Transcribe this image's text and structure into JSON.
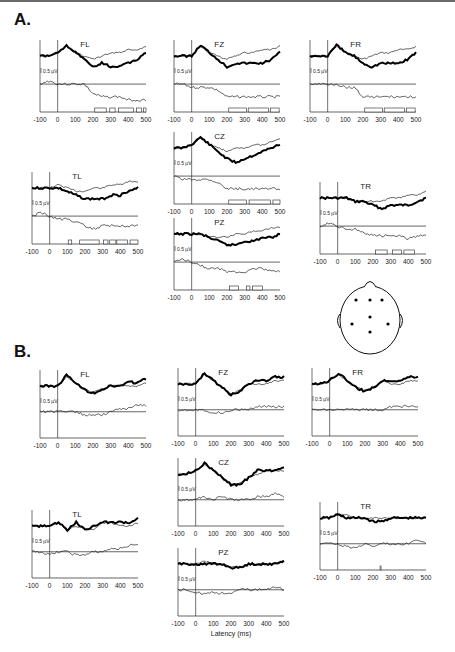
{
  "figure": {
    "section_a_label": "A.",
    "section_b_label": "B.",
    "x_axis_label": "Latency (ms)",
    "scale_bar_label": "0.5 µV",
    "head_map": {
      "electrodes": [
        "FL",
        "FZ",
        "FR",
        "CZ",
        "TL",
        "TR",
        "PZ"
      ]
    }
  },
  "chart_data": [
    {
      "section": "A",
      "type": "line",
      "x_ticks": [
        -100,
        0,
        100,
        200,
        300,
        400,
        500
      ],
      "xlabel": "Latency (ms)",
      "scale_bar": "0.5 µV",
      "panels": [
        {
          "electrode": "FL",
          "thick": [
            0,
            0,
            -1,
            -3,
            -1,
            1,
            3,
            2,
            3,
            3,
            2,
            1,
            -1
          ],
          "thin": [
            0,
            0,
            -1,
            -3,
            -1,
            0,
            1,
            0,
            -1,
            -1,
            -2,
            -2,
            -3
          ],
          "diff": [
            0,
            -1,
            0,
            0,
            0,
            0,
            3,
            4,
            4,
            4,
            5,
            5,
            5
          ],
          "sig_bars": [
            [
              210,
              275
            ],
            [
              295,
              325
            ],
            [
              345,
              430
            ],
            [
              445,
              475
            ],
            [
              485,
              500
            ]
          ]
        },
        {
          "electrode": "FZ",
          "thick": [
            0,
            0,
            0,
            -3,
            -1,
            1,
            3,
            2,
            2,
            2,
            2,
            1,
            -1
          ],
          "thin": [
            0,
            0,
            0,
            -3,
            -1,
            0,
            1,
            0,
            -1,
            -1,
            -2,
            -2,
            -3
          ],
          "diff": [
            0,
            0,
            1,
            1,
            1,
            2,
            4,
            4,
            4,
            4,
            4,
            4,
            4
          ],
          "sig_bars": [
            [
              210,
              310
            ],
            [
              320,
              435
            ],
            [
              445,
              495
            ]
          ]
        },
        {
          "electrode": "FR",
          "thick": [
            0,
            0,
            0,
            -3,
            -1,
            0,
            2,
            3,
            2,
            2,
            2,
            1,
            -1
          ],
          "thin": [
            0,
            0,
            0,
            -3,
            -1,
            0,
            1,
            0,
            -1,
            -1,
            -2,
            -2,
            -3
          ],
          "diff": [
            0,
            0,
            0,
            0,
            1,
            1,
            4,
            4,
            4,
            4,
            4,
            4,
            4
          ],
          "sig_bars": [
            [
              210,
              310
            ],
            [
              320,
              435
            ],
            [
              445,
              495
            ]
          ]
        },
        {
          "electrode": "CZ",
          "thick": [
            0,
            0,
            -1,
            -3,
            -1,
            1,
            3,
            4,
            3,
            2,
            1,
            0,
            -1
          ],
          "thin": [
            0,
            0,
            -1,
            -3,
            -1,
            0,
            1,
            0,
            0,
            -1,
            -1,
            -2,
            -3
          ],
          "diff": [
            0,
            1,
            1,
            1,
            1,
            2,
            4,
            4,
            4,
            4,
            4,
            4,
            4
          ],
          "sig_bars": [
            [
              210,
              310
            ],
            [
              325,
              445
            ],
            [
              460,
              500
            ]
          ]
        },
        {
          "electrode": "TL",
          "thick": [
            0,
            0,
            0,
            0,
            1,
            2,
            3,
            3,
            3,
            2,
            2,
            1,
            0
          ],
          "thin": [
            0,
            0,
            0,
            -1,
            0,
            1,
            1,
            0,
            0,
            -1,
            -1,
            -2,
            -2
          ],
          "diff": [
            0,
            -1,
            0,
            1,
            1,
            2,
            3,
            4,
            3,
            3,
            3,
            3,
            3
          ],
          "sig_bars": [
            [
              105,
              125
            ],
            [
              170,
              280
            ],
            [
              305,
              330
            ],
            [
              340,
              375
            ],
            [
              380,
              440
            ],
            [
              455,
              500
            ]
          ]
        },
        {
          "electrode": "TR",
          "thick": [
            0,
            0,
            0,
            0,
            1,
            1,
            2,
            3,
            2,
            2,
            2,
            1,
            0
          ],
          "thin": [
            0,
            0,
            0,
            0,
            1,
            1,
            1,
            1,
            0,
            0,
            -1,
            -1,
            -2
          ],
          "diff": [
            0,
            -1,
            0,
            1,
            1,
            2,
            3,
            3,
            3,
            3,
            4,
            3,
            3
          ],
          "sig_bars": [
            [
              215,
              280
            ],
            [
              310,
              360
            ],
            [
              375,
              435
            ]
          ]
        },
        {
          "electrode": "PZ",
          "thick": [
            0,
            0,
            0,
            0,
            1,
            2,
            3,
            3,
            2,
            2,
            1,
            1,
            0
          ],
          "thin": [
            0,
            0,
            0,
            0,
            1,
            1,
            1,
            0,
            0,
            -1,
            -1,
            -2,
            -2
          ],
          "diff": [
            0,
            -1,
            0,
            1,
            2,
            2,
            3,
            3,
            3,
            2,
            2,
            3,
            3
          ],
          "sig_bars": [
            [
              215,
              265
            ],
            [
              310,
              330
            ],
            [
              345,
              400
            ]
          ]
        }
      ]
    },
    {
      "section": "B",
      "type": "line",
      "x_ticks": [
        -100,
        0,
        100,
        200,
        300,
        400,
        500
      ],
      "xlabel": "Latency (ms)",
      "scale_bar": "0.5 µV",
      "panels": [
        {
          "electrode": "FL",
          "thick": [
            0,
            0,
            0,
            -3,
            -1,
            1,
            2,
            1,
            0,
            0,
            -1,
            -1,
            -2
          ],
          "thin": [
            0,
            0,
            0,
            -3,
            -1,
            1,
            2,
            1,
            0,
            0,
            0,
            0,
            -1
          ],
          "diff": [
            0,
            0,
            0,
            0,
            0,
            1,
            1,
            1,
            0,
            -1,
            -1,
            -2,
            -2
          ]
        },
        {
          "electrode": "FZ",
          "thick": [
            0,
            0,
            0,
            -3,
            -1,
            1,
            3,
            2,
            0,
            -1,
            -1,
            -2,
            -2
          ],
          "thin": [
            0,
            0,
            0,
            -3,
            -1,
            1,
            3,
            2,
            0,
            0,
            0,
            -1,
            -1
          ],
          "diff": [
            0,
            0,
            0,
            0,
            1,
            1,
            0,
            0,
            0,
            -1,
            -1,
            -1,
            -1
          ]
        },
        {
          "electrode": "FR",
          "thick": [
            0,
            0,
            -1,
            -3,
            -1,
            1,
            2,
            1,
            -1,
            -1,
            -1,
            -2,
            -2
          ],
          "thin": [
            0,
            0,
            -1,
            -3,
            -1,
            1,
            2,
            1,
            -1,
            0,
            0,
            -1,
            -1
          ],
          "diff": [
            0,
            0,
            0,
            0,
            0,
            0,
            0,
            0,
            0,
            -1,
            -1,
            -1,
            -1
          ]
        },
        {
          "electrode": "CZ",
          "thick": [
            0,
            0,
            -1,
            -3,
            -1,
            1,
            3,
            3,
            1,
            -1,
            -1,
            -1,
            -2
          ],
          "thin": [
            0,
            0,
            -1,
            -3,
            -1,
            1,
            3,
            3,
            1,
            0,
            -1,
            -1,
            -1
          ],
          "diff": [
            0,
            0,
            0,
            -1,
            0,
            -1,
            0,
            0,
            0,
            -1,
            -1,
            -2,
            -1
          ]
        },
        {
          "electrode": "TL",
          "thick": [
            0,
            0,
            0,
            -1,
            1,
            -1,
            1,
            0,
            -1,
            -1,
            -1,
            -1,
            -2
          ],
          "thin": [
            0,
            0,
            0,
            -1,
            1,
            0,
            1,
            1,
            -1,
            -1,
            0,
            0,
            -1
          ],
          "diff": [
            0,
            0,
            1,
            0,
            0,
            1,
            1,
            0,
            0,
            -1,
            -1,
            -2,
            -2
          ]
        },
        {
          "electrode": "TR",
          "thick": [
            0,
            0,
            -1,
            0,
            0,
            0,
            1,
            1,
            0,
            0,
            0,
            0,
            0
          ],
          "thin": [
            0,
            0,
            -1,
            -1,
            0,
            0,
            0,
            0,
            0,
            0,
            0,
            0,
            0
          ],
          "diff": [
            0,
            0,
            0,
            1,
            1,
            0,
            1,
            0,
            0,
            0,
            0,
            -1,
            0
          ],
          "sig_bars": [
            [
              240,
              245
            ]
          ]
        },
        {
          "electrode": "PZ",
          "thick": [
            0,
            0,
            0,
            0,
            0,
            0,
            1,
            1,
            0,
            0,
            0,
            0,
            -1
          ],
          "thin": [
            0,
            0,
            0,
            -1,
            0,
            0,
            1,
            1,
            0,
            0,
            0,
            0,
            -1
          ],
          "diff": [
            0,
            0,
            1,
            1,
            1,
            1,
            1,
            0,
            0,
            0,
            0,
            -1,
            0
          ]
        }
      ]
    }
  ]
}
